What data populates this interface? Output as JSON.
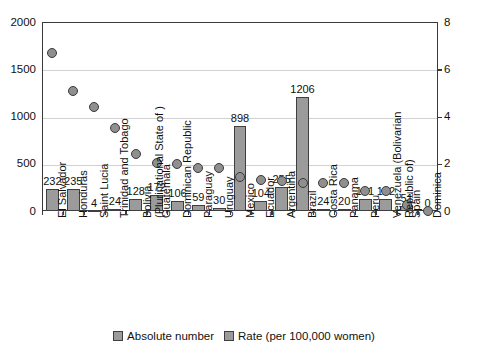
{
  "chart_data": {
    "type": "bar",
    "title": "",
    "subtitle": "",
    "xlabel": "",
    "ylabel": "",
    "y2label": "",
    "grid": true,
    "legend_position": "bottom",
    "ylim": [
      0,
      2000
    ],
    "y2lim": [
      0,
      8
    ],
    "yticks": [
      "0",
      "500",
      "1000",
      "1500",
      "2000"
    ],
    "y2ticks": [
      "0",
      "2",
      "4",
      "6",
      "8"
    ],
    "categories": [
      "El Salvador",
      "Honduras",
      "Saint Lucia",
      "Trinidad and Tobago",
      "Bolivia\n(Plurinational State of )",
      "Guatemala",
      "Dominican Republic",
      "Paraguay",
      "Uruguay",
      "Mexico",
      "Ecuador",
      "Argentina",
      "Brazil",
      "Costa Rica",
      "Panama",
      "Peru",
      "Venezuela (Bolivarian\nRepublic of)",
      "Spain",
      "Dominica"
    ],
    "series": [
      {
        "name": "Absolute number",
        "kind": "bar",
        "axis": "left",
        "color": "#9b9b9b",
        "values": [
          232,
          235,
          4,
          24,
          128,
          172,
          106,
          59,
          30,
          898,
          104,
          255,
          1206,
          24,
          20,
          131,
          132,
          51,
          0
        ],
        "labels": [
          "232",
          "235",
          "4",
          "24",
          "128",
          "172",
          "106",
          "59",
          "30",
          "898",
          "104",
          "255",
          "1206",
          "24",
          "20",
          "131",
          "132",
          "51",
          "0"
        ]
      },
      {
        "name": "Rate (per 100,000 women)",
        "kind": "scatter",
        "axis": "right",
        "color": "#8f8f8f",
        "values": [
          6.7,
          5.1,
          4.4,
          3.5,
          2.4,
          2.05,
          2.0,
          1.8,
          1.8,
          1.45,
          1.3,
          1.25,
          1.2,
          1.2,
          1.2,
          0.85,
          0.85,
          0.25,
          0.0
        ]
      }
    ],
    "legend": [
      "Absolute number",
      "Rate (per 100,000 women)"
    ]
  }
}
